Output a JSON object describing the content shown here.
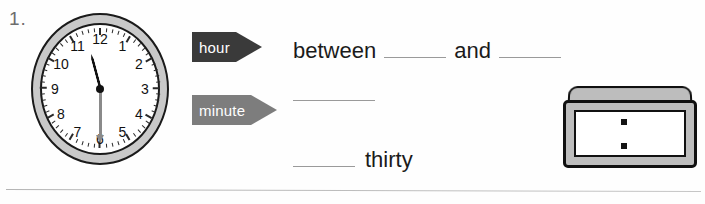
{
  "item": {
    "number_label": "1.",
    "divider_present": true
  },
  "analog_clock": {
    "name": "analog-clock",
    "time_shown": "11:30",
    "hour_hand_angle_deg": 345,
    "minute_hand_angle_deg": 180,
    "numerals": [
      "12",
      "1",
      "2",
      "3",
      "4",
      "5",
      "6",
      "7",
      "8",
      "9",
      "10",
      "11"
    ],
    "bezel_color": "#c9c9c9",
    "face_color": "#ffffff",
    "outline_color": "#1a1a1a",
    "hour_hand_color": "#111111",
    "minute_hand_color": "#8a8a8a",
    "tick_count": 60
  },
  "callouts": [
    {
      "id": "hour",
      "label": "hour",
      "fill_color": "#3a3a3a",
      "text_color": "#ffffff",
      "direction": "right"
    },
    {
      "id": "minute",
      "label": "minute",
      "fill_color": "#7d7d7d",
      "text_color": "#ffffff",
      "direction": "right"
    }
  ],
  "answers": {
    "hour_line": {
      "prefix": "between",
      "middle": "and",
      "blank_1_value": "",
      "blank_2_value": ""
    },
    "minute_line": {
      "blank_1_value": ""
    },
    "thirty_line": {
      "blank_1_value": "",
      "suffix": "thirty"
    },
    "blank_rule_color": "#9a9a9a"
  },
  "digital_clock": {
    "name": "digital-clock",
    "display_value": "",
    "separator": ":",
    "case_color": "#bdbdbd",
    "screen_color": "#ffffff",
    "outline_color": "#101010"
  }
}
